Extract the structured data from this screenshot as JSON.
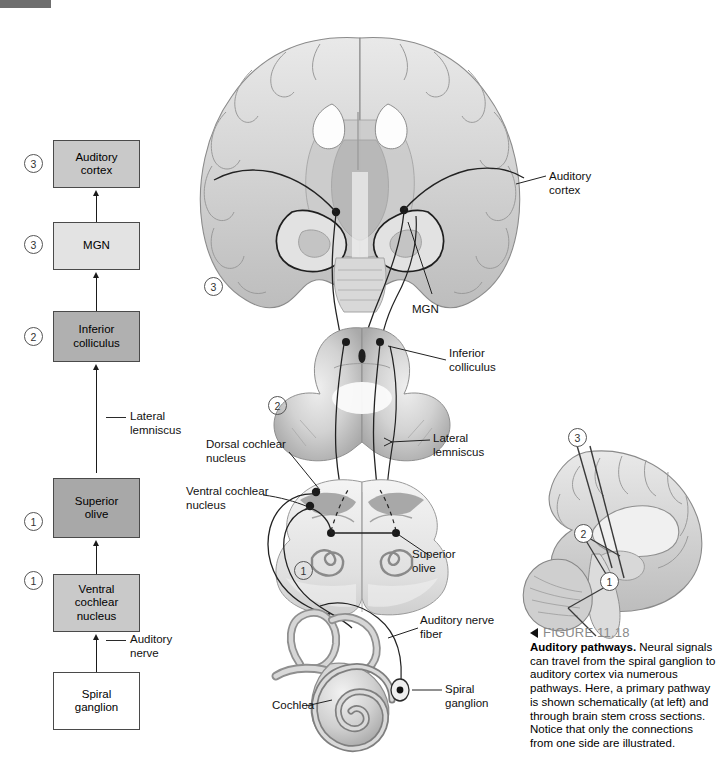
{
  "figure": {
    "number": "FIGURE 11.18",
    "title": "Auditory pathways.",
    "caption": "Neural signals can travel from the spiral ganglion to auditory cortex via numerous pathways. Here, a primary pathway is shown schematically (at left) and through brain stem cross sections. Notice that only the connections from one side are illustrated."
  },
  "flowchart": {
    "boxes": [
      {
        "id": "auditory-cortex",
        "label": "Auditory\ncortex",
        "marker": "3",
        "fill": "#c9c9c9"
      },
      {
        "id": "mgn",
        "label": "MGN",
        "marker": "3",
        "fill": "#e3e3e3"
      },
      {
        "id": "inferior-colliculus",
        "label": "Inferior\ncolliculus",
        "marker": "2",
        "fill": "#b0b0b0"
      },
      {
        "id": "superior-olive",
        "label": "Superior\nolive",
        "marker": "1",
        "fill": "#a8a8a8"
      },
      {
        "id": "ventral-cochlear-nucleus",
        "label": "Ventral\ncochlear\nnucleus",
        "marker": "1",
        "fill": "#c9c9c9"
      },
      {
        "id": "spiral-ganglion",
        "label": "Spiral\nganglion",
        "marker": "",
        "fill": "#ffffff"
      }
    ],
    "connector_labels": [
      {
        "id": "lateral-lemniscus",
        "label": "Lateral\nlemniscus"
      },
      {
        "id": "auditory-nerve",
        "label": "Auditory\nnerve"
      }
    ]
  },
  "anatomy_labels": {
    "auditory_cortex": "Auditory\ncortex",
    "mgn": "MGN",
    "inferior_colliculus": "Inferior\ncolliculus",
    "lateral_lemniscus": "Lateral\nlemniscus",
    "dorsal_cochlear_nucleus": "Dorsal cochlear\nnucleus",
    "ventral_cochlear_nucleus": "Ventral cochlear\nnucleus",
    "superior_olive": "Superior\nolive",
    "auditory_nerve_fiber": "Auditory nerve\nfiber",
    "spiral_ganglion": "Spiral\nganglion",
    "cochlea": "Cochlea"
  },
  "section_markers": {
    "forebrain": "3",
    "midbrain": "2",
    "brainstem": "1",
    "inset_top": "3",
    "inset_mid": "2",
    "inset_bottom": "1"
  },
  "colors": {
    "marker_bar": "#6e6e6e",
    "tissue_gray": "#b4b4b4",
    "tissue_light": "#e8e8e8",
    "tissue_mid": "#d0d0d0",
    "tissue_dark": "#8f8f8f",
    "outline": "#6a6a6a",
    "tract": "#2a2a2a"
  }
}
